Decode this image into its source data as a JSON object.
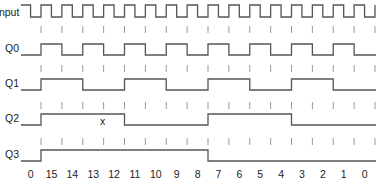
{
  "diagram": {
    "type": "timing-diagram",
    "colors": {
      "waveform": "#555555",
      "tick": "#999999",
      "text": "#222222",
      "background": "#ffffff"
    },
    "signals": [
      {
        "name": "Input",
        "label": "Input",
        "kind": "clock"
      },
      {
        "name": "Q0",
        "label": "Q0",
        "kind": "toggle",
        "period_ticks": 1
      },
      {
        "name": "Q1",
        "label": "Q1",
        "kind": "toggle",
        "period_ticks": 2
      },
      {
        "name": "Q2",
        "label": "Q2",
        "kind": "toggle",
        "period_ticks": 4,
        "annotation": "x"
      },
      {
        "name": "Q3",
        "label": "Q3",
        "kind": "toggle",
        "period_ticks": 8
      }
    ],
    "counter_values": [
      "0",
      "15",
      "14",
      "13",
      "12",
      "11",
      "10",
      "9",
      "8",
      "7",
      "6",
      "5",
      "4",
      "3",
      "2",
      "1",
      "0"
    ],
    "annotation_mark": "x"
  }
}
